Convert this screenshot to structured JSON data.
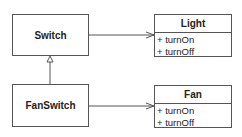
{
  "diagram": {
    "classes": [
      {
        "id": "switch",
        "name": "Switch"
      },
      {
        "id": "fanswitch",
        "name": "FanSwitch"
      },
      {
        "id": "light",
        "name": "Light",
        "methods": [
          "+ turnOn",
          "+ turnOff"
        ]
      },
      {
        "id": "fan",
        "name": "Fan",
        "methods": [
          "+ turnOn",
          "+ turnOff"
        ]
      }
    ],
    "relations": [
      {
        "from": "switch",
        "to": "light",
        "type": "association"
      },
      {
        "from": "fanswitch",
        "to": "fan",
        "type": "association"
      },
      {
        "from": "fanswitch",
        "to": "switch",
        "type": "generalization"
      }
    ],
    "colors": {
      "line": "#555555",
      "background": "#ffffff",
      "text": "#222222"
    }
  }
}
